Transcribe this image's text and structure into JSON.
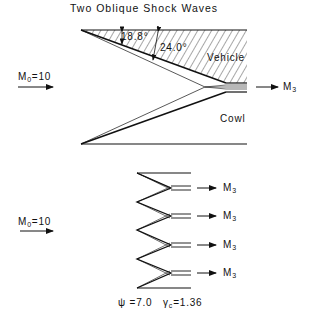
{
  "title": "Two Oblique Shock Waves",
  "top_diagram": {
    "inflow": {
      "symbol": "M",
      "subscript": "0",
      "value": "=10"
    },
    "outflow": {
      "symbol": "M",
      "subscript": "3"
    },
    "angle_1": "18.8°",
    "angle_2": "24.0°",
    "vehicle_label": "Vehicle",
    "cowl_label": "Cowl"
  },
  "bottom_diagram": {
    "inflow": {
      "symbol": "M",
      "subscript": "0",
      "value": "=10"
    },
    "outflows": [
      {
        "symbol": "M",
        "subscript": "3"
      },
      {
        "symbol": "M",
        "subscript": "3"
      },
      {
        "symbol": "M",
        "subscript": "3"
      },
      {
        "symbol": "M",
        "subscript": "3"
      }
    ],
    "psi_label": "ψ =7.0",
    "gamma_symbol": "γ",
    "gamma_subscript": "c",
    "gamma_value": "=1.36"
  }
}
